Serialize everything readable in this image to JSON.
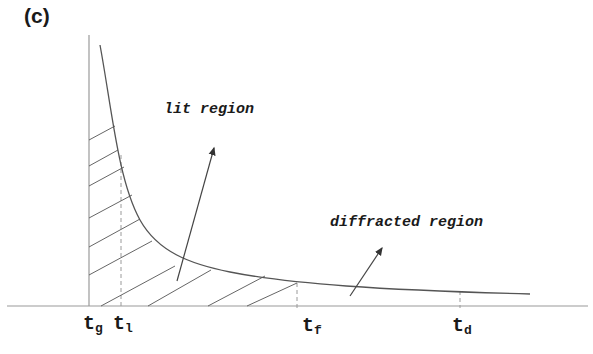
{
  "panel": {
    "label": "(c)"
  },
  "regions": {
    "lit": {
      "label": "lit region"
    },
    "diffracted": {
      "label": "diffracted region"
    }
  },
  "axis_ticks": [
    {
      "base": "t",
      "sub": "g",
      "x": 89
    },
    {
      "base": "t",
      "sub": "l",
      "x": 121
    },
    {
      "base": "t",
      "sub": "f",
      "x": 297
    },
    {
      "base": "t",
      "sub": "d",
      "x": 460
    }
  ],
  "colors": {
    "line": "#555555",
    "axis": "#9a9a9a",
    "text": "#1a1a1a",
    "background": "#ffffff"
  }
}
